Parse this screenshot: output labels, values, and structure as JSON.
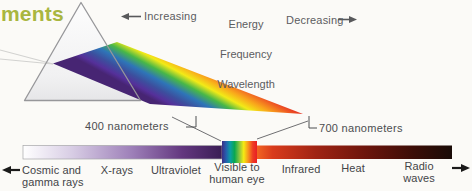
{
  "heading": {
    "text": "ments",
    "color": "#a9b640"
  },
  "direction_labels": {
    "increasing": "Increasing",
    "decreasing": "Decreasing",
    "quantities": {
      "line1": "Energy",
      "line2": "Frequency",
      "line3": "Wavelength"
    }
  },
  "callouts": {
    "left": "400 nanometers",
    "right": "700 nanometers"
  },
  "spectrum_bands": [
    {
      "name": "cosmic-gamma",
      "label": "Cosmic and\ngamma rays"
    },
    {
      "name": "x-rays",
      "label": "X-rays"
    },
    {
      "name": "ultraviolet",
      "label": "Ultraviolet"
    },
    {
      "name": "visible",
      "label": "Visible to\nhuman eye"
    },
    {
      "name": "infrared",
      "label": "Infrared"
    },
    {
      "name": "heat",
      "label": "Heat"
    },
    {
      "name": "radio-waves",
      "label": "Radio waves"
    }
  ],
  "colors": {
    "heading": "#a9b640",
    "label_text": "#4c4d50",
    "bar_left_start": "#ffffff",
    "bar_left_end": "#3a1d55",
    "visible_left": "#3b2d86",
    "visible_right": "#e81e25",
    "bar_right_start": "#f26522",
    "bar_right_end": "#190b07"
  }
}
